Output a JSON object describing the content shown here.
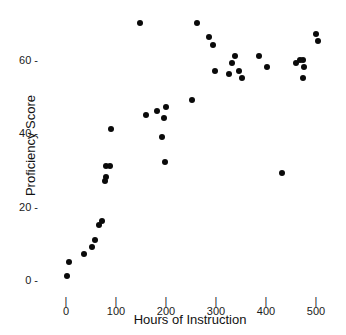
{
  "chart_data": {
    "type": "scatter",
    "title": "",
    "xlabel": "Hours of Instruction",
    "ylabel": "Proficiency Score",
    "xlim": [
      -25,
      540
    ],
    "ylim": [
      -4,
      74
    ],
    "grid": false,
    "legend": null,
    "xticks": [
      0,
      100,
      200,
      300,
      400,
      500
    ],
    "xtick_labels": [
      "0",
      "100",
      "200",
      "300",
      "400",
      "500"
    ],
    "yticks": [
      0,
      20,
      40,
      60
    ],
    "ytick_labels": [
      "0",
      "20",
      "40",
      "60"
    ],
    "marker": {
      "shape": "circle",
      "color": "#0a0a0a",
      "size": 6
    },
    "series": [
      {
        "name": "observations",
        "points": [
          [
            2,
            1
          ],
          [
            6,
            5
          ],
          [
            36,
            7
          ],
          [
            52,
            9
          ],
          [
            58,
            11
          ],
          [
            65,
            15
          ],
          [
            72,
            16
          ],
          [
            78,
            27
          ],
          [
            79,
            28
          ],
          [
            80,
            31
          ],
          [
            88,
            31
          ],
          [
            90,
            41
          ],
          [
            148,
            70
          ],
          [
            160,
            45
          ],
          [
            182,
            46
          ],
          [
            192,
            39
          ],
          [
            196,
            44
          ],
          [
            200,
            47
          ],
          [
            198,
            32
          ],
          [
            252,
            49
          ],
          [
            262,
            70
          ],
          [
            285,
            66
          ],
          [
            293,
            64
          ],
          [
            298,
            57
          ],
          [
            325,
            56
          ],
          [
            332,
            59
          ],
          [
            338,
            61
          ],
          [
            345,
            57
          ],
          [
            352,
            55
          ],
          [
            386,
            61
          ],
          [
            402,
            58
          ],
          [
            432,
            29
          ],
          [
            460,
            59
          ],
          [
            468,
            60
          ],
          [
            474,
            60
          ],
          [
            476,
            58
          ],
          [
            474,
            55
          ],
          [
            500,
            67
          ],
          [
            503,
            65
          ]
        ]
      }
    ]
  },
  "axes": {
    "x_title": "Hours of Instruction",
    "y_title": "Proficiency Score"
  }
}
